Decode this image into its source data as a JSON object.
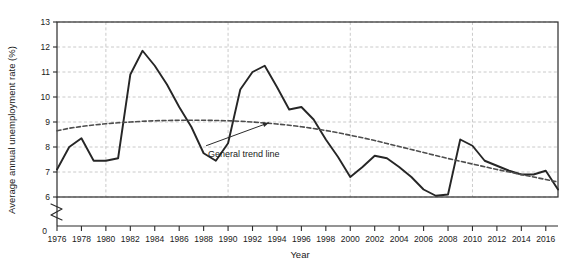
{
  "chart_data": {
    "type": "line",
    "title": "",
    "xlabel": "Year",
    "ylabel": "Average annual unemployment rate (%)",
    "xlim": [
      1976,
      2017
    ],
    "ylim": [
      6,
      13
    ],
    "y_axis_break": true,
    "y_axis_origin_label": "0",
    "grid": true,
    "legend": "none",
    "y_ticks": [
      6,
      7,
      8,
      9,
      10,
      11,
      12,
      13
    ],
    "x_ticks": [
      1976,
      1978,
      1980,
      1982,
      1984,
      1986,
      1988,
      1990,
      1992,
      1994,
      1996,
      1998,
      2000,
      2002,
      2004,
      2006,
      2008,
      2010,
      2012,
      2014,
      2016
    ],
    "x_tick_labels": [
      "1976",
      "1978",
      "1980",
      "1982",
      "1984",
      "1986",
      "1988",
      "1990",
      "1992",
      "1994",
      "1996",
      "1998",
      "2000",
      "2002",
      "2004",
      "2006",
      "2008",
      "2010",
      "2012",
      "2014",
      "2016"
    ],
    "x": [
      1976,
      1977,
      1978,
      1979,
      1980,
      1981,
      1982,
      1983,
      1984,
      1985,
      1986,
      1987,
      1988,
      1989,
      1990,
      1991,
      1992,
      1993,
      1994,
      1995,
      1996,
      1997,
      1998,
      1999,
      2000,
      2001,
      2002,
      2003,
      2004,
      2005,
      2006,
      2007,
      2008,
      2009,
      2010,
      2011,
      2012,
      2013,
      2014,
      2015,
      2016,
      2017
    ],
    "series": [
      {
        "name": "Average annual unemployment rate (%)",
        "style": "solid",
        "color": "#262626",
        "values": [
          7.1,
          8.0,
          8.35,
          7.45,
          7.45,
          7.55,
          10.9,
          11.85,
          11.25,
          10.5,
          9.6,
          8.8,
          7.75,
          7.45,
          8.15,
          10.3,
          11.0,
          11.25,
          10.4,
          9.5,
          9.6,
          9.1,
          8.3,
          7.6,
          6.8,
          7.2,
          7.65,
          7.55,
          7.2,
          6.8,
          6.3,
          6.05,
          6.1,
          8.3,
          8.05,
          7.45,
          7.25,
          7.05,
          6.9,
          6.9,
          7.05,
          6.3
        ]
      },
      {
        "name": "General trend line",
        "style": "dashed",
        "color": "#4d4d4d",
        "values": [
          8.65,
          8.75,
          8.82,
          8.88,
          8.93,
          8.97,
          9.0,
          9.03,
          9.05,
          9.06,
          9.07,
          9.07,
          9.07,
          9.06,
          9.05,
          9.03,
          9.0,
          8.96,
          8.92,
          8.87,
          8.81,
          8.74,
          8.66,
          8.57,
          8.47,
          8.37,
          8.26,
          8.14,
          8.02,
          7.9,
          7.78,
          7.66,
          7.54,
          7.43,
          7.32,
          7.21,
          7.1,
          7.0,
          6.9,
          6.8,
          6.7,
          6.6
        ]
      }
    ],
    "annotations": [
      {
        "text": "General trend line",
        "target_x": 1993.5,
        "target_y": 9.0,
        "label_x": 1988.2,
        "label_y": 8.05
      }
    ]
  }
}
